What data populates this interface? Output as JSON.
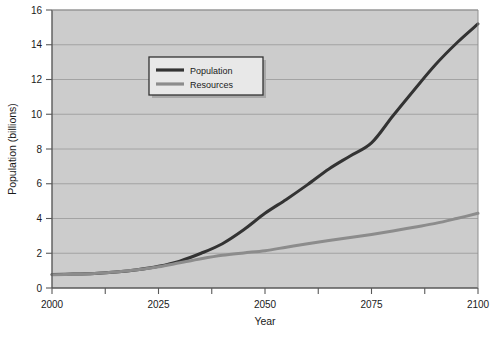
{
  "chart_data": {
    "type": "line",
    "title": "",
    "subtitle": "",
    "xlabel": "Year",
    "ylabel": "Population (billions)",
    "xlim": [
      2000,
      2100
    ],
    "ylim": [
      0,
      16
    ],
    "grid": "horizontal",
    "legend_position": "upper-left-inside",
    "xticks": [
      2000,
      2025,
      2050,
      2075,
      2100
    ],
    "xtick_labels": [
      "2000",
      "2025",
      "2050",
      "2075",
      "2100"
    ],
    "x_minor_tick_step": 12.5,
    "yticks": [
      0,
      2,
      4,
      6,
      8,
      10,
      12,
      14,
      16
    ],
    "ytick_labels": [
      "0",
      "2",
      "4",
      "6",
      "8",
      "10",
      "12",
      "14",
      "16"
    ],
    "x": [
      2000,
      2005,
      2010,
      2015,
      2020,
      2025,
      2030,
      2035,
      2040,
      2045,
      2050,
      2055,
      2060,
      2065,
      2070,
      2075,
      2080,
      2085,
      2090,
      2095,
      2100
    ],
    "series": [
      {
        "name": "Population",
        "color": "#333333",
        "linewidth": 3.0,
        "values": [
          0.78,
          0.8,
          0.84,
          0.92,
          1.05,
          1.25,
          1.55,
          2.0,
          2.55,
          3.35,
          4.3,
          5.1,
          5.95,
          6.85,
          7.6,
          8.35,
          9.9,
          11.4,
          12.85,
          14.1,
          15.2
        ]
      },
      {
        "name": "Resources",
        "color": "#8c8c8c",
        "linewidth": 3.0,
        "values": [
          0.76,
          0.79,
          0.84,
          0.92,
          1.05,
          1.22,
          1.45,
          1.68,
          1.88,
          2.02,
          2.15,
          2.35,
          2.55,
          2.73,
          2.9,
          3.08,
          3.28,
          3.5,
          3.72,
          4.0,
          4.3
        ]
      }
    ],
    "annotations": []
  },
  "legend": {
    "entries": [
      {
        "label": "Population"
      },
      {
        "label": "Resources"
      }
    ]
  },
  "style": {
    "figure_background": "#ffffff",
    "plot_background": "#cccccc",
    "grid_color": "#9e9e9e",
    "axis_color": "#595959",
    "text_color": "#1a1a1a",
    "legend_background": "#e8e8e8",
    "legend_border": "#333333",
    "legend_shadow": "#a8a8a8"
  }
}
